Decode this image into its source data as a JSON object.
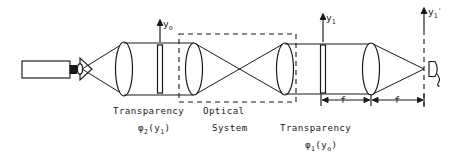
{
  "figure": {
    "type": "optical-ray-diagram",
    "width": 471,
    "height": 153,
    "background_color": "#ffffff",
    "line_color": "#1a1a1a"
  },
  "axis_labels": [
    {
      "id": "y0",
      "text": "y",
      "sub": "o",
      "prime": "",
      "x": 161,
      "y": 26
    },
    {
      "id": "y1",
      "text": "y",
      "sub": "1",
      "prime": "",
      "x": 325,
      "y": 20
    },
    {
      "id": "y1p",
      "text": "y",
      "sub": "1",
      "prime": "'",
      "x": 428,
      "y": 14
    }
  ],
  "captions": {
    "transparency_2": {
      "line1": "Transparency",
      "symbol": "φ",
      "subscript": "2",
      "argument": "(y",
      "arg_sub": "1",
      "argument_close": ")"
    },
    "optical_system": {
      "line1": "Optical",
      "line2": "System"
    },
    "transparency_1": {
      "line1": "Transparency",
      "symbol": "φ",
      "subscript": "1",
      "argument": "(y",
      "arg_sub": "o",
      "argument_close": ")"
    }
  },
  "dimensions": [
    {
      "id": "f-left",
      "label": "f",
      "from_x": 321,
      "to_x": 371,
      "y": 100
    },
    {
      "id": "f-right",
      "label": "f",
      "from_x": 371,
      "to_x": 424,
      "y": 100
    }
  ],
  "components": [
    {
      "id": "laser",
      "name": "laser-source",
      "kind": "rectangle",
      "x": 22,
      "y": 61,
      "w": 48,
      "h": 16
    },
    {
      "id": "laser-nub",
      "name": "laser-output-nub",
      "kind": "rectangle",
      "x": 70,
      "y": 65,
      "w": 6,
      "h": 8
    },
    {
      "id": "pinhole",
      "name": "spatial-filter-pinhole",
      "kind": "cone",
      "x": 80,
      "y": 69
    },
    {
      "id": "lens-collimate",
      "name": "collimating-lens",
      "kind": "lens",
      "cx": 124,
      "cy": 69,
      "rx": 8,
      "ry": 27
    },
    {
      "id": "plate-2",
      "name": "transparency-plate-2",
      "kind": "plate",
      "cx": 160,
      "cy": 69,
      "w": 5,
      "h": 48
    },
    {
      "id": "lens-ft-1",
      "name": "fourier-transform-lens-1",
      "kind": "lens",
      "cx": 194,
      "cy": 69,
      "rx": 8,
      "ry": 26
    },
    {
      "id": "lens-ft-2",
      "name": "fourier-transform-lens-2",
      "kind": "lens",
      "cx": 285,
      "cy": 69,
      "rx": 8,
      "ry": 26
    },
    {
      "id": "plate-1",
      "name": "transparency-plate-1",
      "kind": "plate",
      "cx": 323,
      "cy": 69,
      "w": 5,
      "h": 48
    },
    {
      "id": "lens-final",
      "name": "output-fourier-lens",
      "kind": "lens",
      "cx": 371,
      "cy": 69,
      "rx": 8,
      "ry": 26
    },
    {
      "id": "detector",
      "name": "photodetector",
      "kind": "detector",
      "x": 428,
      "y": 69
    },
    {
      "id": "optical-box",
      "name": "optical-system-boundary",
      "kind": "dashed-box",
      "x": 179,
      "y": 34,
      "w": 117,
      "h": 68
    },
    {
      "id": "output-plane",
      "name": "output-plane-dashed-line",
      "kind": "dashed-line",
      "x": 424,
      "y1": 30,
      "y2": 108
    }
  ]
}
